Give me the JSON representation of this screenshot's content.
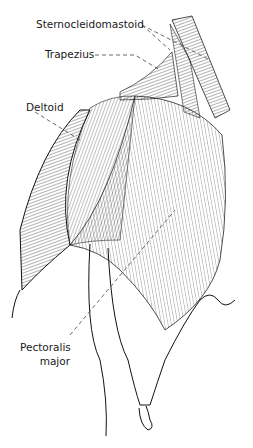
{
  "figure": {
    "type": "anatomical-illustration",
    "labels": [
      {
        "id": "scm",
        "text": "Sternocleidomastoid"
      },
      {
        "id": "trap",
        "text": "Trapezius"
      },
      {
        "id": "delt",
        "text": "Deltoid"
      },
      {
        "id": "pec1",
        "text": "Pectoralis"
      },
      {
        "id": "pec2",
        "text": "major"
      }
    ],
    "colors": {
      "ink": "#1a1a1a",
      "background": "#ffffff"
    }
  }
}
